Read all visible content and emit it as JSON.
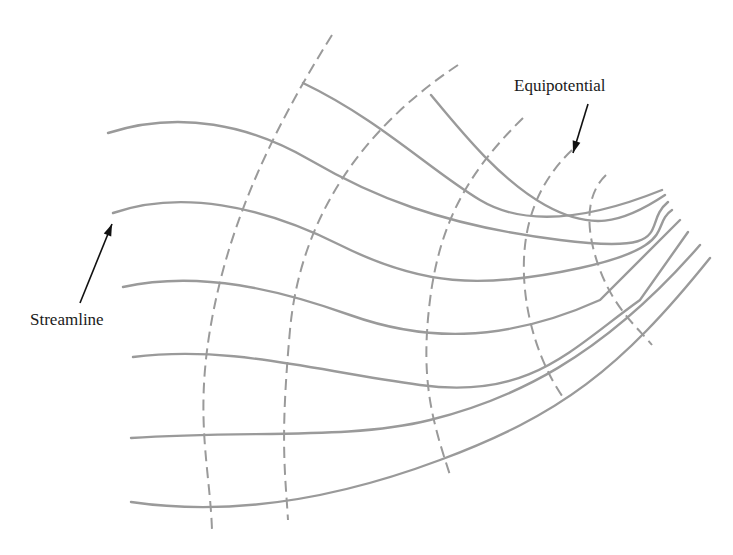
{
  "diagram": {
    "labels": {
      "equipotential": "Equipotential",
      "streamline": "Streamline"
    },
    "colors": {
      "lines": "#9a9a9a",
      "text": "#1a1a1a",
      "arrow": "#111111",
      "background": "#ffffff"
    },
    "streamlines": [
      {
        "id": "s1",
        "d": "M 303 83 C 380 120, 430 170, 480 200 S 600 215, 662 190"
      },
      {
        "id": "s2",
        "d": "M 431 95 C 460 130, 500 180, 545 205 S 620 225, 665 195"
      },
      {
        "id": "s3",
        "d": "M 108 133 C 180 110, 250 125, 310 160 S 440 225, 560 240 S 640 225, 668 202"
      },
      {
        "id": "s4",
        "d": "M 113 213 C 180 190, 260 205, 340 245 S 480 290, 580 268 S 650 225, 672 210"
      },
      {
        "id": "s5",
        "d": "M 123 287 C 200 270, 280 290, 350 315 S 500 345, 600 300 L 680 220"
      },
      {
        "id": "s6",
        "d": "M 133 357 C 230 345, 310 370, 420 385 S 570 350, 640 300 L 688 232"
      },
      {
        "id": "s7",
        "d": "M 131 438 C 250 430, 350 440, 430 420 S 600 360, 700 245"
      },
      {
        "id": "s8",
        "d": "M 131 502 C 220 515, 320 505, 440 460 S 620 370, 710 258"
      }
    ],
    "equipotentials": [
      {
        "id": "e1",
        "d": "M 332 35 C 260 150, 225 240, 210 330 S 210 470, 212 530"
      },
      {
        "id": "e2",
        "d": "M 458 65 C 360 130, 300 220, 290 330 S 285 470, 288 520"
      },
      {
        "id": "e3",
        "d": "M 523 118 C 470 170, 440 220, 430 300 S 432 420, 450 475"
      },
      {
        "id": "e4",
        "d": "M 572 150 C 530 190, 520 240, 525 290 S 550 380, 565 400"
      },
      {
        "id": "e5",
        "d": "M 606 175 C 585 195, 585 230, 600 270 S 640 330, 652 345"
      }
    ],
    "annotations": [
      {
        "name": "equipotential-arrow",
        "from": [
          588,
          104
        ],
        "to": [
          573,
          153
        ]
      },
      {
        "name": "streamline-arrow",
        "from": [
          80,
          303
        ],
        "to": [
          112,
          224
        ]
      }
    ]
  }
}
